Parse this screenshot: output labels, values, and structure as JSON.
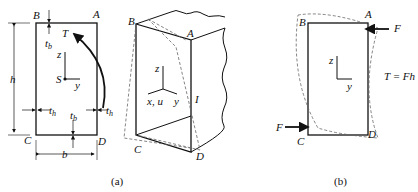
{
  "figure_a": {
    "caption": "(a)",
    "section": {
      "corners": {
        "A": "A",
        "B": "B",
        "C": "C",
        "D": "D"
      },
      "torque": "T",
      "shear_center": "S",
      "axis_z": "z",
      "axis_y": "y",
      "height": "h",
      "width": "b",
      "thickness_b": "t",
      "thickness_b_sub": "b",
      "thickness_h": "t",
      "thickness_h_sub": "h"
    },
    "isometric": {
      "corners": {
        "A": "A",
        "B": "B",
        "C": "C",
        "D": "D"
      },
      "axis_z": "z",
      "axis_x": "x, u",
      "axis_y": "y",
      "point_I": "I"
    }
  },
  "figure_b": {
    "caption": "(b)",
    "corners": {
      "A": "A",
      "B": "B",
      "C": "C",
      "D": "D"
    },
    "force_top": "F",
    "force_bottom": "F",
    "axis_z": "z",
    "axis_y": "y",
    "equation": "T = Fh"
  }
}
